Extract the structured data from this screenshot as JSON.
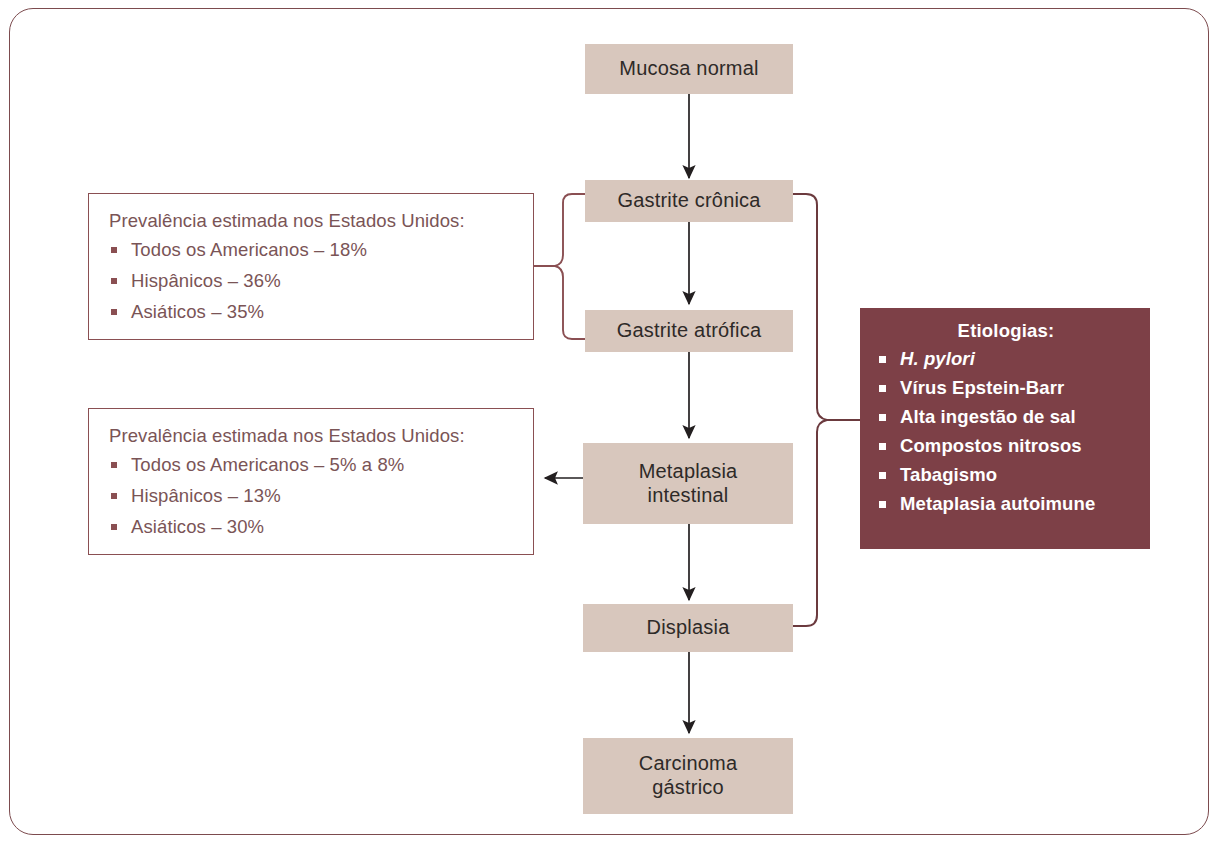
{
  "diagram": {
    "colors": {
      "box_fill": "#d8c7bd",
      "box_text": "#2e2a28",
      "maroon_line": "#8a4f52",
      "maroon_fill": "#7d4047",
      "frame_border": "#7c4b4e",
      "arrow": "#231f20"
    },
    "flow_steps": [
      {
        "id": "mucosa",
        "label": "Mucosa normal"
      },
      {
        "id": "gastrite-cronica",
        "label": "Gastrite crônica"
      },
      {
        "id": "gastrite-atrofica",
        "label": "Gastrite atrófica"
      },
      {
        "id": "metaplasia",
        "label": "Metaplasia\nintestinal",
        "line1": "Metaplasia",
        "line2": "intestinal"
      },
      {
        "id": "displasia",
        "label": "Displasia"
      },
      {
        "id": "carcinoma",
        "label": "Carcinoma\ngástrico",
        "line1": "Carcinoma",
        "line2": "gástrico"
      }
    ],
    "prevalence_gastritis": {
      "title": "Prevalência estimada nos Estados Unidos:",
      "items": [
        "Todos os Americanos – 18%",
        "Hispânicos – 36%",
        "Asiáticos – 35%"
      ]
    },
    "prevalence_metaplasia": {
      "title": "Prevalência estimada nos Estados Unidos:",
      "items": [
        "Todos os Americanos – 5% a 8%",
        "Hispânicos – 13%",
        "Asiáticos – 30%"
      ]
    },
    "etiologies": {
      "title": "Etiologias:",
      "items": [
        {
          "text": "H. pylori",
          "italic": true
        },
        {
          "text": "Vírus Epstein-Barr",
          "italic": false
        },
        {
          "text": "Alta ingestão de sal",
          "italic": false
        },
        {
          "text": "Compostos nitrosos",
          "italic": false
        },
        {
          "text": "Tabagismo",
          "italic": false
        },
        {
          "text": "Metaplasia autoimune",
          "italic": false
        }
      ]
    }
  }
}
